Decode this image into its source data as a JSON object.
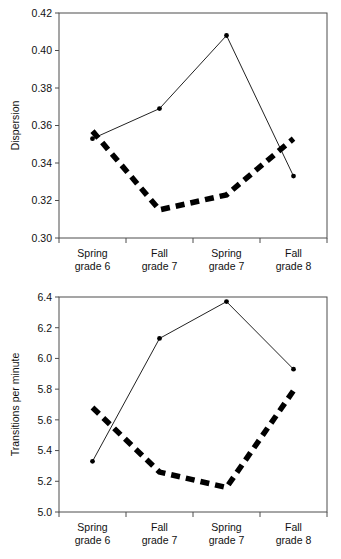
{
  "chart_data": [
    {
      "type": "line",
      "title": "",
      "xlabel": "",
      "ylabel": "Dispersion",
      "categories": [
        "Spring grade 6",
        "Fall grade 7",
        "Spring grade 7",
        "Fall grade 8"
      ],
      "category_lines": [
        [
          "Spring",
          "grade 6"
        ],
        [
          "Fall",
          "grade 7"
        ],
        [
          "Spring",
          "grade 7"
        ],
        [
          "Fall",
          "grade 8"
        ]
      ],
      "ylim": [
        0.3,
        0.42
      ],
      "ytick_labels": [
        "0.30",
        "0.32",
        "0.34",
        "0.36",
        "0.38",
        "0.40",
        "0.42"
      ],
      "ytick_values": [
        0.3,
        0.32,
        0.34,
        0.36,
        0.38,
        0.4,
        0.42
      ],
      "grid": false,
      "legend": "none",
      "series": [
        {
          "name": "solid-series",
          "style": "solid-with-markers",
          "values": [
            0.353,
            0.369,
            0.408,
            0.333
          ]
        },
        {
          "name": "dashed-series",
          "style": "thick-dashed",
          "values": [
            0.357,
            0.315,
            0.323,
            0.353
          ]
        }
      ]
    },
    {
      "type": "line",
      "title": "",
      "xlabel": "",
      "ylabel": "Transitions per minute",
      "categories": [
        "Spring grade 6",
        "Fall grade 7",
        "Spring grade 7",
        "Fall grade 8"
      ],
      "category_lines": [
        [
          "Spring",
          "grade 6"
        ],
        [
          "Fall",
          "grade 7"
        ],
        [
          "Spring",
          "grade 7"
        ],
        [
          "Fall",
          "grade 8"
        ]
      ],
      "ylim": [
        5.0,
        6.4
      ],
      "ytick_labels": [
        "5.0",
        "5.2",
        "5.4",
        "5.6",
        "5.8",
        "6.0",
        "6.2",
        "6.4"
      ],
      "ytick_values": [
        5.0,
        5.2,
        5.4,
        5.6,
        5.8,
        6.0,
        6.2,
        6.4
      ],
      "grid": false,
      "legend": "none",
      "series": [
        {
          "name": "solid-series",
          "style": "solid-with-markers",
          "values": [
            5.33,
            6.13,
            6.37,
            5.93
          ]
        },
        {
          "name": "dashed-series",
          "style": "thick-dashed",
          "values": [
            5.68,
            5.26,
            5.16,
            5.79
          ]
        }
      ]
    }
  ],
  "figures": {
    "dispersion": {
      "ylabel": "Dispersion"
    },
    "transitions": {
      "ylabel": "Transitions per minute"
    }
  }
}
